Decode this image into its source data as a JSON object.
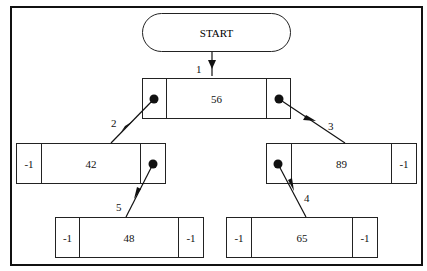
{
  "diagram": {
    "type": "binary-search-tree-linked-list",
    "start_label": "START",
    "nodes": [
      {
        "id": "n56",
        "left": "ptr",
        "value": "56",
        "right": "ptr"
      },
      {
        "id": "n42",
        "left": "-1",
        "value": "42",
        "right": "ptr"
      },
      {
        "id": "n89",
        "left": "ptr",
        "value": "89",
        "right": "-1"
      },
      {
        "id": "n48",
        "left": "-1",
        "value": "48",
        "right": "-1"
      },
      {
        "id": "n65",
        "left": "-1",
        "value": "65",
        "right": "-1"
      }
    ],
    "edges": [
      {
        "label": "1",
        "from": "START",
        "to": "56"
      },
      {
        "label": "2",
        "from": "56.left",
        "to": "42"
      },
      {
        "label": "3",
        "from": "56.right",
        "to": "89"
      },
      {
        "label": "4",
        "from": "89.left",
        "to": "65"
      },
      {
        "label": "5",
        "from": "42.right",
        "to": "48"
      }
    ]
  },
  "labels": {
    "start": "START",
    "e1": "1",
    "e2": "2",
    "e3": "3",
    "e4": "4",
    "e5": "5",
    "n56": {
      "value": "56"
    },
    "n42": {
      "left": "-1",
      "value": "42"
    },
    "n89": {
      "value": "89",
      "right": "-1"
    },
    "n48": {
      "left": "-1",
      "value": "48",
      "right": "-1"
    },
    "n65": {
      "left": "-1",
      "value": "65",
      "right": "-1"
    }
  },
  "colors": {
    "line": "#111111",
    "background": "#ffffff"
  }
}
